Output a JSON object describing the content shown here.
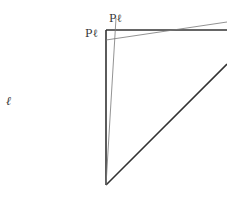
{
  "diagram": {
    "labels": {
      "left": "ℓ",
      "top": "Pℓ",
      "corner": "Pℓ"
    },
    "colors": {
      "thick_line": "#333333",
      "thin_line": "#777777",
      "text": "#333333"
    }
  }
}
